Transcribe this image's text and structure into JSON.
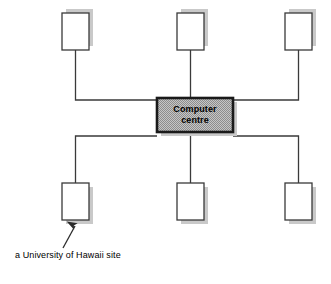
{
  "diagram": {
    "type": "network-topology",
    "title": "",
    "background_color": "#ffffff",
    "line_color": "#3a3a3a",
    "shadow_color": "#c9c9c9",
    "node_fill": "#ffffff",
    "hub_fill": "#b8b8b8",
    "hub_border_color": "#1a1a1a",
    "text_color": "#000000",
    "hub": {
      "name": "computer-centre",
      "label_line1": "Computer",
      "label_line2": "centre",
      "x": 157,
      "y": 98,
      "width": 76,
      "height": 34
    },
    "nodes": [
      {
        "name": "site-top-left",
        "x": 62,
        "y": 13,
        "width": 27,
        "height": 37
      },
      {
        "name": "site-top-center",
        "x": 177,
        "y": 13,
        "width": 27,
        "height": 37
      },
      {
        "name": "site-top-right",
        "x": 285,
        "y": 13,
        "width": 27,
        "height": 37
      },
      {
        "name": "site-bottom-left",
        "x": 62,
        "y": 183,
        "width": 27,
        "height": 37
      },
      {
        "name": "site-bottom-center",
        "x": 177,
        "y": 183,
        "width": 27,
        "height": 37
      },
      {
        "name": "site-bottom-right",
        "x": 285,
        "y": 183,
        "width": 27,
        "height": 37
      }
    ],
    "bus_top_y": 100,
    "bus_bottom_y": 136,
    "annotation": {
      "name": "university-of-hawaii-site",
      "text": "a University of Hawaii site",
      "text_x": 15,
      "text_y": 255,
      "arrow_from_x": 63,
      "arrow_from_y": 248,
      "arrow_to_x": 75,
      "arrow_to_y": 224,
      "points_to": "site-bottom-left"
    }
  }
}
